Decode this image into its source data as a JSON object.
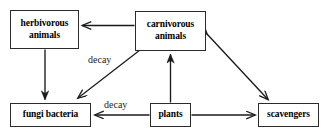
{
  "diagram": {
    "nodes": [
      {
        "id": "herbivorous",
        "label": "herbivorous\nanimals"
      },
      {
        "id": "carnivorous",
        "label": "carnivorous\nanimals"
      },
      {
        "id": "fungi",
        "label": "fungi bacteria"
      },
      {
        "id": "plants",
        "label": "plants"
      },
      {
        "id": "scavengers",
        "label": "scavengers"
      }
    ],
    "edges": [
      {
        "id": "carnivorous-to-herbivorous",
        "from": "carnivorous animals",
        "to": "herbivorous animals",
        "label": "",
        "direction": "one-way"
      },
      {
        "id": "herbivorous-to-fungi",
        "from": "herbivorous animals",
        "to": "fungi bacteria",
        "label": "",
        "direction": "one-way"
      },
      {
        "id": "carnivorous-to-fungi",
        "from": "carnivorous animals",
        "to": "fungi bacteria",
        "label": "decay",
        "direction": "one-way"
      },
      {
        "id": "plants-to-fungi",
        "from": "plants",
        "to": "fungi bacteria",
        "label": "decay",
        "direction": "one-way"
      },
      {
        "id": "plants-to-carnivorous",
        "from": "plants",
        "to": "carnivorous animals",
        "label": "",
        "direction": "one-way"
      },
      {
        "id": "plants-to-scavengers",
        "from": "plants",
        "to": "scavengers",
        "label": "",
        "direction": "one-way"
      },
      {
        "id": "carnivorous-scavengers",
        "from": "carnivorous animals",
        "to": "scavengers",
        "label": "",
        "direction": "two-way"
      }
    ],
    "labels": {
      "decay_carnivorous": "decay",
      "decay_plants": "decay"
    },
    "colors": {
      "box_border": "#2b2b2b",
      "box_fill": "#ffffff",
      "arrow": "#1a1a1a",
      "text": "#000000",
      "label_text": "#1c1c1c",
      "background": "#ffffff"
    }
  }
}
